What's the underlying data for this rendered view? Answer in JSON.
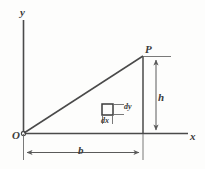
{
  "figure": {
    "kind": "geometry-diagram",
    "colors": {
      "background": "#fdfdfc",
      "stroke": "#4a4a4a",
      "dimension_stroke": "#5a5a5a",
      "text": "#3b3b3b"
    },
    "axes": {
      "y_label": "y",
      "x_label": "x",
      "origin_label": "O"
    },
    "points": {
      "p_label": "P"
    },
    "dimensions": {
      "height_label": "h",
      "base_label": "b"
    },
    "element": {
      "dy_label": "dy",
      "dx_label": "dx"
    }
  }
}
